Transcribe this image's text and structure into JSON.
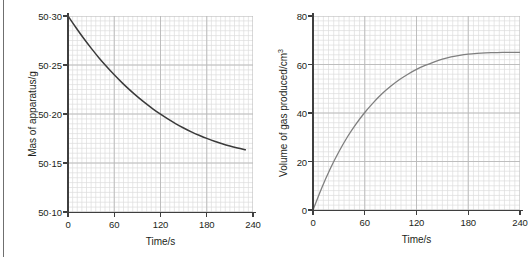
{
  "page": {
    "background_color": "#ffffff",
    "edge_rule_color": "#6f6f6f"
  },
  "style": {
    "grid_minor_color": "#dcdcdc",
    "grid_major_color": "#b9b9b9",
    "axis_color": "#3f3f3f",
    "text_color": "#231f20"
  },
  "charts": {
    "left": {
      "title": "",
      "ylabel": "Mas of apparatus/g",
      "xlabel": "Time/s",
      "ytick_labels": [
        "50·10",
        "50·15",
        "50·20",
        "50·25",
        "50·30"
      ],
      "xtick_labels": [
        "0",
        "60",
        "120",
        "180",
        "240"
      ],
      "curve_color": "#3a3a3a"
    },
    "right": {
      "title": "",
      "ylabel_main": "Volume of gas produced/cm",
      "ylabel_sup": "3",
      "xlabel": "Time/s",
      "ytick_labels": [
        "0",
        "20",
        "40",
        "60",
        "80"
      ],
      "xtick_labels": [
        "0",
        "60",
        "120",
        "180",
        "240"
      ],
      "curve_color": "#7f7f7f"
    }
  },
  "chart_data": [
    {
      "id": "mass-vs-time",
      "type": "line",
      "title": "",
      "xlabel": "Time/s",
      "ylabel": "Mas of apparatus/g",
      "xlim": [
        0,
        240
      ],
      "ylim": [
        50.1,
        50.3
      ],
      "xticks": [
        0,
        60,
        120,
        180,
        240
      ],
      "yticks": [
        50.1,
        50.15,
        50.2,
        50.25,
        50.3
      ],
      "xtick_labels": [
        "0",
        "60",
        "120",
        "180",
        "240"
      ],
      "ytick_labels": [
        "50·10",
        "50·15",
        "50·20",
        "50·25",
        "50·30"
      ],
      "grid": true,
      "grid_minor_step_x": 6,
      "grid_minor_step_y": 0.005,
      "legend": null,
      "series": [
        {
          "name": "Mass of apparatus",
          "color": "#3a3a3a",
          "x": [
            0,
            10,
            20,
            30,
            40,
            50,
            60,
            70,
            80,
            90,
            100,
            110,
            120,
            130,
            140,
            150,
            160,
            170,
            180,
            190,
            200,
            210,
            220,
            230
          ],
          "y": [
            50.3,
            50.2885,
            50.2775,
            50.2672,
            50.2575,
            50.2485,
            50.24,
            50.232,
            50.2246,
            50.2177,
            50.2113,
            50.2053,
            50.1998,
            50.1947,
            50.19,
            50.1857,
            50.1818,
            50.1783,
            50.1751,
            50.1722,
            50.1696,
            50.1673,
            50.1653,
            50.1635
          ]
        }
      ],
      "notes": "Exponential decay from 50.30 g at t=0 s flattening to approximately 50.115 g by t=230 s; curve ends before the 240 s gridline."
    },
    {
      "id": "gas-volume-vs-time",
      "type": "line",
      "title": "",
      "xlabel": "Time/s",
      "ylabel": "Volume of gas produced/cm3",
      "xlim": [
        0,
        240
      ],
      "ylim": [
        0,
        80
      ],
      "xticks": [
        0,
        60,
        120,
        180,
        240
      ],
      "yticks": [
        0,
        20,
        40,
        60,
        80
      ],
      "xtick_labels": [
        "0",
        "60",
        "120",
        "180",
        "240"
      ],
      "ytick_labels": [
        "0",
        "20",
        "40",
        "60",
        "80"
      ],
      "grid": true,
      "grid_minor_step_x": 6,
      "grid_minor_step_y": 2,
      "legend": null,
      "series": [
        {
          "name": "Volume of gas produced",
          "color": "#7f7f7f",
          "x": [
            0,
            10,
            20,
            30,
            40,
            50,
            60,
            70,
            80,
            90,
            100,
            110,
            120,
            130,
            140,
            150,
            160,
            170,
            180,
            190,
            200,
            210,
            220,
            230,
            240
          ],
          "y": [
            0,
            9.0,
            17.0,
            24.0,
            30.2,
            35.5,
            40.2,
            44.3,
            47.9,
            51.0,
            53.7,
            56.0,
            58.0,
            59.6,
            61.0,
            62.2,
            63.1,
            63.8,
            64.3,
            64.6,
            64.8,
            64.9,
            65.0,
            65.0,
            65.0
          ]
        }
      ],
      "notes": "Rising curve from the origin, steep at first then levelling off at about 65 cm3 after roughly 200 s."
    }
  ]
}
